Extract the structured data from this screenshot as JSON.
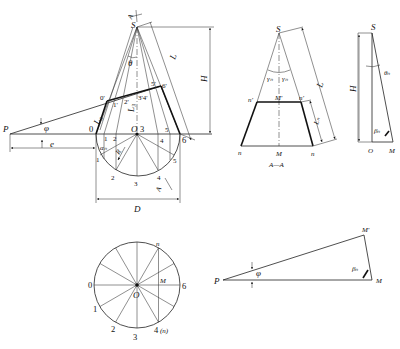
{
  "main_view": {
    "apex": "S",
    "axis_mark": "A",
    "theta": "θ",
    "angle_phi": "φ",
    "point_P": "P",
    "offset_e": "e",
    "dim_H": "H",
    "dim_L": "L",
    "dim_D": "D",
    "L0": "L₀",
    "L3": "L₃",
    "alpha_n": "αₙ",
    "radius": "R",
    "center": "O",
    "top_points": [
      "0'",
      "1'",
      "2'",
      "3'4'",
      "5'",
      "6'"
    ],
    "base_points": [
      "0",
      "1",
      "2",
      "3",
      "4",
      "5",
      "6"
    ],
    "circle_points": [
      "1",
      "2",
      "3",
      "4",
      "5"
    ],
    "section_mark": "A"
  },
  "section_view": {
    "apex": "S",
    "gamma_left": "γₙ",
    "gamma_right": "γₙ",
    "n_prime_left": "n'",
    "M_prime": "M'",
    "n_prime_right": "n'",
    "n_left": "n",
    "M": "M",
    "n_right": "n",
    "dim_L": "L",
    "dim_Ln": "Lₙ",
    "caption": "A—A"
  },
  "right_triangle": {
    "apex": "S",
    "dim_H": "H",
    "theta_n": "θₙ",
    "beta_n": "βₙ",
    "O": "O",
    "M": "M"
  },
  "bottom_circle": {
    "center": "O",
    "labels": [
      "0",
      "1",
      "2",
      "3",
      "4 (n)",
      "6",
      "M",
      "n"
    ],
    "label_0": "0",
    "label_1": "1",
    "label_2": "2",
    "label_3": "3",
    "label_4": "4",
    "label_4n": "(n)",
    "label_6": "6",
    "label_M": "M",
    "label_n": "n",
    "label_O": "O"
  },
  "bottom_triangle": {
    "P": "P",
    "phi": "φ",
    "M_prime": "M'",
    "beta_n": "βₙ",
    "M": "M"
  }
}
